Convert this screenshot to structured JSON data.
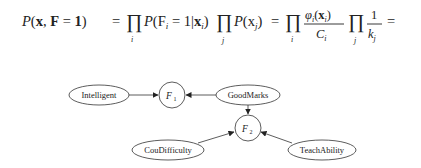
{
  "formula": {
    "lhs": "P(x, F = 1)",
    "parts": [
      {
        "text": "P(",
        "italic_p": true
      },
      {
        "text": "x, F = 1)"
      },
      {
        "text": "="
      },
      {
        "text": "∏",
        "sub": "i"
      },
      {
        "text": "P(F",
        "sub_i": "i",
        "rest": " = 1|x",
        "sub2": "i",
        "close": ")"
      },
      {
        "text": "∏",
        "sub": "j"
      },
      {
        "text": "P(x",
        "sub": "j",
        "close": ")"
      },
      {
        "text": "="
      },
      {
        "text": "∏",
        "sub": "i"
      },
      {
        "fraction": {
          "num": "φi(xi)",
          "den": "Ci"
        }
      },
      {
        "text": "∏",
        "sub": "j"
      },
      {
        "fraction": {
          "num": "1",
          "den": "kj"
        }
      },
      {
        "text": "="
      }
    ],
    "full_text": "P(x, F = 1) = ∏_i P(F_i = 1|x_i) ∏_j P(x_j) = ∏_i φ_i(x_i)/C_i ∏_j 1/k_j ="
  },
  "graph": {
    "nodes": [
      {
        "id": "intelligent",
        "label": "Intelligent",
        "shape": "ellipse"
      },
      {
        "id": "f1",
        "label": "F",
        "sub": "1",
        "shape": "circle"
      },
      {
        "id": "goodmarks",
        "label": "GoodMarks",
        "shape": "ellipse"
      },
      {
        "id": "f2",
        "label": "F",
        "sub": "2",
        "shape": "circle"
      },
      {
        "id": "coudifficulty",
        "label": "CouDifficulty",
        "shape": "ellipse"
      },
      {
        "id": "teachability",
        "label": "TeachAbility",
        "shape": "ellipse"
      }
    ],
    "edges": [
      {
        "from": "intelligent",
        "to": "f1"
      },
      {
        "from": "goodmarks",
        "to": "f1"
      },
      {
        "from": "goodmarks",
        "to": "f2"
      },
      {
        "from": "coudifficulty",
        "to": "f2"
      },
      {
        "from": "teachability",
        "to": "f2"
      }
    ]
  }
}
